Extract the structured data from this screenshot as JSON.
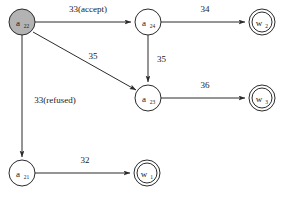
{
  "diagram": {
    "type": "state-transition-graph",
    "background_color": "#ffffff",
    "stroke_color": "#2b2b2b",
    "start_node_fill": "#b3b3b3",
    "nodes": [
      {
        "id": "a22",
        "label": "a",
        "subscript": "22",
        "shape": "circle",
        "start": true,
        "accepting": false,
        "cx": 22,
        "cy": 22,
        "r": 13
      },
      {
        "id": "a24",
        "label": "a",
        "subscript": "24",
        "shape": "circle",
        "start": false,
        "accepting": false,
        "cx": 148,
        "cy": 22,
        "r": 13
      },
      {
        "id": "a23",
        "label": "a",
        "subscript": "23",
        "shape": "circle",
        "start": false,
        "accepting": false,
        "cx": 148,
        "cy": 98,
        "r": 13
      },
      {
        "id": "a21",
        "label": "a",
        "subscript": "21",
        "shape": "circle",
        "start": false,
        "accepting": false,
        "cx": 22,
        "cy": 173,
        "r": 13
      },
      {
        "id": "w2",
        "label": "w",
        "subscript": "2",
        "shape": "double-circle",
        "start": false,
        "accepting": true,
        "cx": 262,
        "cy": 22,
        "r": 13
      },
      {
        "id": "w3",
        "label": "w",
        "subscript": "3",
        "shape": "double-circle",
        "start": false,
        "accepting": true,
        "cx": 262,
        "cy": 98,
        "r": 13
      },
      {
        "id": "w1",
        "label": "w",
        "subscript": "1",
        "shape": "double-circle",
        "start": false,
        "accepting": true,
        "cx": 147,
        "cy": 173,
        "r": 13
      }
    ],
    "edges": [
      {
        "id": "e1",
        "from": "a22",
        "to": "a24",
        "label": "33(accept)",
        "label_x": 88,
        "label_y": 12
      },
      {
        "id": "e2",
        "from": "a22",
        "to": "a23",
        "label": "35",
        "label_x": 93,
        "label_y": 59
      },
      {
        "id": "e3",
        "from": "a22",
        "to": "a21",
        "label": "33(refused)",
        "label_x": 55,
        "label_y": 103
      },
      {
        "id": "e4",
        "from": "a24",
        "to": "w2",
        "label": "34",
        "label_x": 205,
        "label_y": 12
      },
      {
        "id": "e5",
        "from": "a24",
        "to": "a23",
        "label": "35",
        "label_x": 157,
        "label_y": 62
      },
      {
        "id": "e6",
        "from": "a23",
        "to": "w3",
        "label": "36",
        "label_x": 205,
        "label_y": 88
      },
      {
        "id": "e7",
        "from": "a21",
        "to": "w1",
        "label": "32",
        "label_x": 85,
        "label_y": 163
      }
    ]
  }
}
